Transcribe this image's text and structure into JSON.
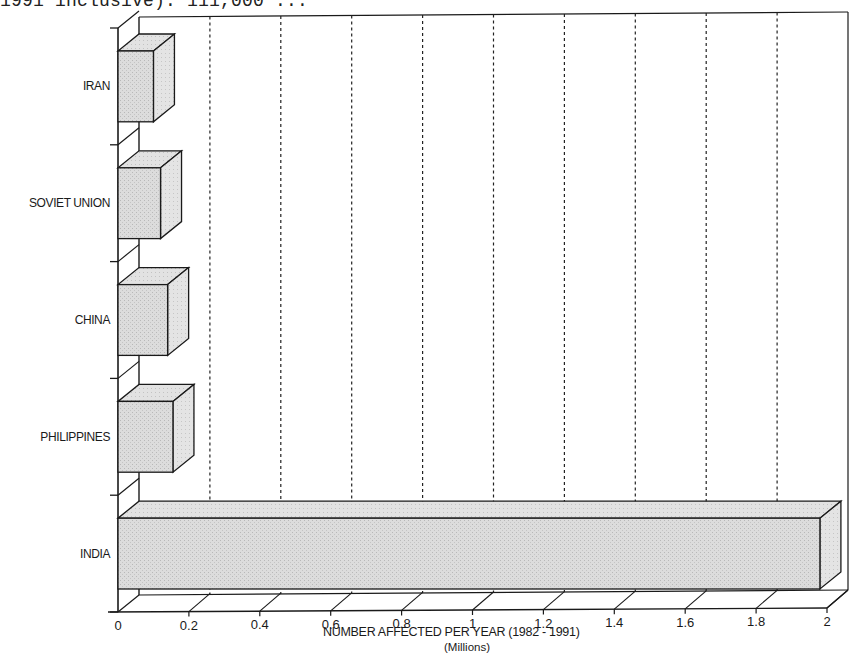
{
  "caption": "1991 inclusive): 111,000 ...",
  "chart_data": {
    "type": "bar",
    "orientation": "horizontal",
    "style": "3d",
    "title": "",
    "categories": [
      "IRAN",
      "SOVIET UNION",
      "CHINA",
      "PHILIPPINES",
      "INDIA"
    ],
    "values": [
      0.1,
      0.12,
      0.14,
      0.155,
      1.98
    ],
    "xlabel": "NUMBER AFFECTED PER YEAR (1982 - 1991)",
    "xlabel_sub": "(Millions)",
    "ylabel": "",
    "xlim": [
      0,
      2
    ],
    "xticks": [
      "0",
      "0.2",
      "0.4",
      "0.6",
      "0.8",
      "1",
      "1.2",
      "1.4",
      "1.6",
      "1.8",
      "2"
    ],
    "grid": "vertical dashed",
    "legend": "none",
    "bar_fill": "#d6d6d6"
  }
}
